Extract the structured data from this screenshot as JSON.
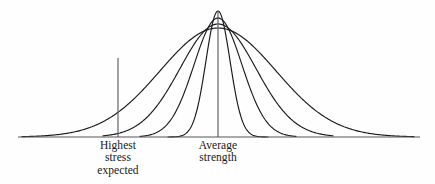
{
  "figure": {
    "background_color": "#fefefe",
    "ink_color": "#1a1a1e",
    "baseline_color": "#55555c",
    "annotations": {
      "highest_stress": {
        "lines": [
          "Highest",
          "stress",
          "expected"
        ],
        "line1": "Highest",
        "line2": "stress",
        "line3": "expected"
      },
      "average_strength": {
        "lines": [
          "Average",
          "strength"
        ],
        "line1": "Average",
        "line2": "strength"
      }
    }
  },
  "chart_data": {
    "type": "line",
    "title": "",
    "xlabel": "",
    "ylabel": "",
    "grid": false,
    "legend": "none",
    "axis": {
      "baseline_y_px": 137,
      "x_min_px": 18,
      "x_max_px": 420,
      "y_top_px": 10
    },
    "mean_x_px": 218,
    "series": [
      {
        "name": "widest-spread curve",
        "peak_y_px": 28,
        "peak_height_px": 109,
        "sigma_px": 58,
        "baseline_left_px": 22,
        "baseline_right_px": 414
      },
      {
        "name": "wide curve",
        "peak_y_px": 24,
        "peak_height_px": 113,
        "sigma_px": 38,
        "baseline_left_px": 103,
        "baseline_right_px": 333
      },
      {
        "name": "narrow curve",
        "peak_y_px": 18,
        "peak_height_px": 119,
        "sigma_px": 24,
        "baseline_left_px": 140,
        "baseline_right_px": 296
      },
      {
        "name": "narrowest-spread curve",
        "peak_y_px": 11,
        "peak_height_px": 126,
        "sigma_px": 12,
        "baseline_left_px": 168,
        "baseline_right_px": 268
      }
    ],
    "reference_lines": [
      {
        "name": "highest-stress-expected",
        "orientation": "vertical",
        "x_px": 118,
        "top_y_px": 58,
        "bottom_y_px": 137,
        "label": "Highest stress expected"
      },
      {
        "name": "average-strength",
        "orientation": "vertical",
        "x_px": 218,
        "top_y_px": 11,
        "bottom_y_px": 137,
        "label": "Average strength"
      }
    ]
  }
}
